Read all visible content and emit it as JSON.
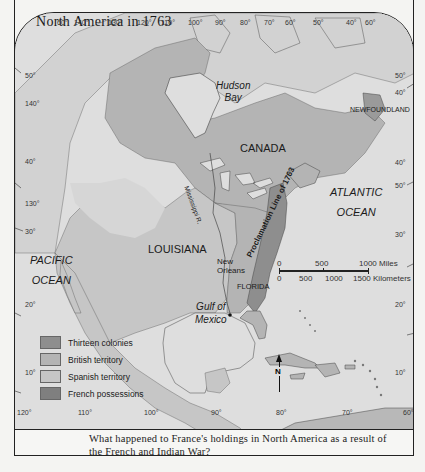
{
  "map": {
    "title": "North America in 1763",
    "caption": "What happened to France's holdings in North America as a result of the French and Indian War?",
    "regions": {
      "hudson_bay": [
        "Hudson",
        "Bay"
      ],
      "canada": "CANADA",
      "newfoundland": "NEWFOUNDLAND",
      "atlantic": [
        "ATLANTIC",
        "OCEAN"
      ],
      "pacific": [
        "PACIFIC",
        "OCEAN"
      ],
      "louisiana": "LOUISIANA",
      "gulf": [
        "Gulf of",
        "Mexico"
      ],
      "new_orleans": [
        "New",
        "Orleans"
      ],
      "florida": "FLORIDA",
      "mississippi": "Mississippi R.",
      "proclamation": "Proclamation Line of 1763"
    },
    "legend": [
      {
        "label": "Thirteen colonies",
        "color": "#8e8e8e"
      },
      {
        "label": "British territory",
        "color": "#b4b4b4"
      },
      {
        "label": "Spanish territory",
        "color": "#c6c6c6"
      },
      {
        "label": "French possessions",
        "color": "#7f7f7f"
      }
    ],
    "scale": {
      "miles": [
        "0",
        "500",
        "1000 Miles"
      ],
      "kilometers": [
        "0",
        "500",
        "1000",
        "1500 Kilometers"
      ]
    },
    "compass": "N",
    "longitude_top": [
      "60°",
      "140°",
      "130°",
      "120°",
      "110°",
      "100°",
      "90°",
      "80°",
      "70°",
      "60°",
      "50°",
      "40°",
      "60°"
    ],
    "longitude_bottom": [
      "120°",
      "110°",
      "100°",
      "90°",
      "80°",
      "70°",
      "60°"
    ],
    "latitude_left": [
      "50°",
      "140°",
      "40°",
      "130°",
      "30°",
      "20°",
      "10°"
    ],
    "latitude_right": [
      "50°",
      "40°",
      "40°",
      "50°",
      "30°",
      "20°",
      "10°"
    ],
    "colors": {
      "water": "#dedede",
      "unclaimed": "#d2d2d2",
      "british": "#b4b4b4",
      "spanish": "#c6c6c6",
      "colonies": "#8e8e8e",
      "french": "#7f7f7f",
      "border": "#222222"
    }
  }
}
